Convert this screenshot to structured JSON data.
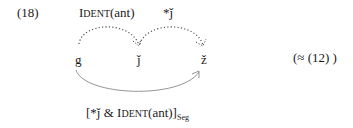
{
  "example": {
    "number": "(18)",
    "reference": "(≈ (12) )"
  },
  "constraints": {
    "ident": {
      "prefix": "I",
      "rest": "dent",
      "arg": "(ant)"
    },
    "markedness": "*ǰ"
  },
  "segments": [
    {
      "label": "g"
    },
    {
      "label": "ǰ"
    },
    {
      "label": "ž"
    }
  ],
  "conjoined_constraint": {
    "open": "[*ǰ & ",
    "ident_prefix": "I",
    "ident_rest": "dent",
    "ident_arg": "(ant)]",
    "subscript": "Seg"
  },
  "arrows": [
    {
      "from": "g",
      "to": "ǰ",
      "style": "dotted",
      "label": "IDENT(ant)"
    },
    {
      "from": "ǰ",
      "to": "ž",
      "style": "dotted",
      "label": "*ǰ"
    },
    {
      "from": "g",
      "to": "ž",
      "style": "solid",
      "label": "[*ǰ & IDENT(ant)]Seg"
    }
  ],
  "colors": {
    "text": "#1a1a1a",
    "dotted_arc": "#444444",
    "solid_arc": "#888888"
  }
}
